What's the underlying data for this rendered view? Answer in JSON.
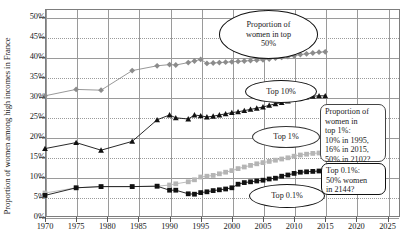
{
  "chart_data": {
    "type": "line",
    "title": "",
    "xlabel": "",
    "ylabel": "Proportion of women among high incomes in France",
    "xlim": [
      1970,
      2027
    ],
    "ylim": [
      0,
      52
    ],
    "grid": true,
    "legend_position": "none",
    "xticks": [
      "1970",
      "1975",
      "1980",
      "1985",
      "1990",
      "1995",
      "2000",
      "2005",
      "2010",
      "2015",
      "2020",
      "2025"
    ],
    "yticks": [
      "0%",
      "5%",
      "10%",
      "15%",
      "20%",
      "25%",
      "30%",
      "35%",
      "40%",
      "45%",
      "50%"
    ],
    "series": [
      {
        "name": "Proportion of women in top 50%",
        "marker": "diamond",
        "color": "#8c8c8c",
        "x": [
          1970,
          1975,
          1979,
          1984,
          1988,
          1990,
          1991,
          1993,
          1994,
          1995,
          1996,
          1997,
          1998,
          1999,
          2000,
          2001,
          2002,
          2003,
          2004,
          2005,
          2006,
          2007,
          2008,
          2009,
          2010,
          2011,
          2012,
          2013,
          2014,
          2015
        ],
        "values": [
          30.3,
          31.9,
          31.7,
          36.6,
          37.8,
          38.1,
          38.0,
          38.6,
          39.0,
          39.4,
          38.4,
          38.5,
          38.6,
          38.7,
          38.8,
          38.9,
          39.0,
          39.1,
          39.2,
          39.3,
          39.5,
          39.7,
          39.9,
          40.1,
          40.3,
          40.6,
          40.8,
          41.0,
          41.2,
          41.3
        ]
      },
      {
        "name": "Top 10%",
        "marker": "triangle",
        "color": "#111111",
        "x": [
          1970,
          1975,
          1979,
          1984,
          1988,
          1990,
          1991,
          1993,
          1994,
          1995,
          1996,
          1997,
          1998,
          1999,
          2000,
          2001,
          2002,
          2003,
          2004,
          2005,
          2006,
          2007,
          2008,
          2009,
          2010,
          2011,
          2012,
          2013,
          2014,
          2015
        ],
        "values": [
          17.1,
          18.6,
          16.7,
          18.9,
          24.3,
          25.5,
          24.8,
          24.5,
          25.5,
          25.3,
          25.0,
          25.2,
          25.5,
          25.8,
          26.1,
          26.3,
          26.6,
          26.9,
          27.2,
          27.5,
          27.9,
          28.3,
          28.6,
          29.0,
          29.4,
          29.8,
          30.0,
          30.2,
          30.3,
          30.3
        ]
      },
      {
        "name": "Top 1%",
        "marker": "square",
        "color": "#b5b5b5",
        "x": [
          1970,
          1975,
          1979,
          1984,
          1988,
          1990,
          1991,
          1993,
          1994,
          1995,
          1996,
          1997,
          1998,
          1999,
          2000,
          2001,
          2002,
          2003,
          2004,
          2005,
          2006,
          2007,
          2008,
          2009,
          2010,
          2011,
          2012,
          2013,
          2014,
          2015
        ],
        "values": [
          6.0,
          7.3,
          7.6,
          7.6,
          7.7,
          8.0,
          8.3,
          8.8,
          9.3,
          10.0,
          10.2,
          10.4,
          10.8,
          11.2,
          11.6,
          12.1,
          12.5,
          12.9,
          13.3,
          13.6,
          13.9,
          14.2,
          14.5,
          14.8,
          15.2,
          15.5,
          15.7,
          15.9,
          16.0,
          16.0
        ]
      },
      {
        "name": "Top 0.1%",
        "marker": "square",
        "color": "#111111",
        "x": [
          1970,
          1975,
          1979,
          1984,
          1988,
          1990,
          1991,
          1993,
          1994,
          1995,
          1996,
          1997,
          1998,
          1999,
          2000,
          2001,
          2002,
          2003,
          2004,
          2005,
          2006,
          2007,
          2008,
          2009,
          2010,
          2011,
          2012,
          2013,
          2014,
          2015
        ],
        "values": [
          5.4,
          7.3,
          7.6,
          7.6,
          7.7,
          6.7,
          6.7,
          5.8,
          5.7,
          6.1,
          6.3,
          6.6,
          6.8,
          7.0,
          7.3,
          8.2,
          8.6,
          8.8,
          9.0,
          9.2,
          9.5,
          9.7,
          10.2,
          10.5,
          10.9,
          11.2,
          11.3,
          11.4,
          11.5,
          11.5
        ]
      }
    ],
    "annotations": [
      {
        "id": "top50-callout",
        "shape": "ellipse",
        "text": "Proportion of\nwomen in top\n50%"
      },
      {
        "id": "top10-callout",
        "shape": "ellipse",
        "text": "Top 10%"
      },
      {
        "id": "top1-callout",
        "shape": "ellipse",
        "text": "Top 1%"
      },
      {
        "id": "top01-callout",
        "shape": "ellipse",
        "text": "Top 0.1%"
      },
      {
        "id": "top1-box",
        "shape": "box",
        "text": "Proportion of\nwomen in\ntop 1%:\n10% in 1995,\n16% in 2015,\n50% in 2102?"
      },
      {
        "id": "top01-box",
        "shape": "box",
        "text": "Top 0.1%:\n50% women\nin 2144?"
      }
    ]
  }
}
